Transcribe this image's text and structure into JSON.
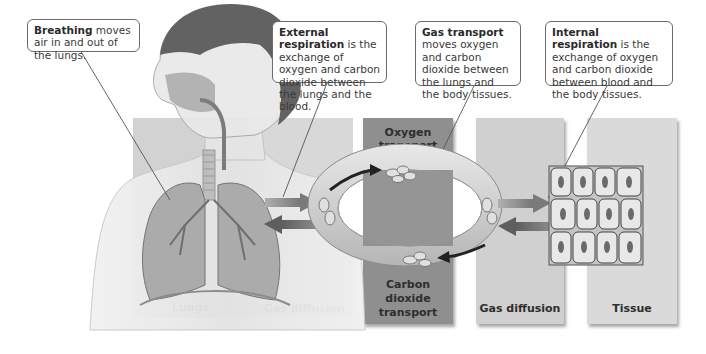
{
  "callouts": [
    {
      "id": "breathing",
      "term": "Breathing",
      "text": " moves air in and out of the lungs."
    },
    {
      "id": "external",
      "term": "External respiration",
      "text": " is the exchange of oxygen and carbon dioxide between the lungs and the blood."
    },
    {
      "id": "transport",
      "term": "Gas transport",
      "text": " moves oxygen and carbon dioxide between the lungs and the body tissues."
    },
    {
      "id": "internal",
      "term": "Internal respiration",
      "text": " is the exchange of oxygen and carbon dioxide between blood and the body tissues."
    }
  ],
  "panels": [
    {
      "id": "lungs",
      "label": "Lungs",
      "color": "#c9c9c9"
    },
    {
      "id": "gas-diffusion-1",
      "label": "Gas diffusion",
      "color": "#d3d3d3"
    },
    {
      "id": "transport",
      "label_top": "Oxygen transport",
      "label_top_1": "Oxygen",
      "label_top_2": "transport",
      "label_bottom_1": "Carbon",
      "label_bottom_2": "dioxide",
      "label_bottom_3": "transport",
      "color": "#8f8f8f"
    },
    {
      "id": "gas-diffusion-2",
      "label": "Gas diffusion",
      "color": "#cfcfcf"
    },
    {
      "id": "tissue",
      "label": "Tissue",
      "color": "#d8d8d8"
    }
  ],
  "colors": {
    "loop": "#d6d6d6",
    "arrow_in": "#9a9a9a",
    "arrow_out": "#6f6f6f",
    "callout_border": "#6b6b6b"
  }
}
